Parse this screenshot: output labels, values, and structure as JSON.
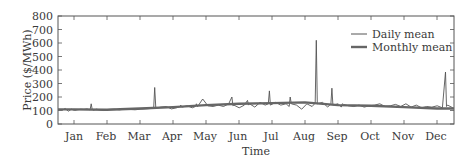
{
  "chart_data": {
    "type": "line",
    "title": "",
    "xlabel": "Time",
    "ylabel": "Price ($/MWh)",
    "ylim": [
      0,
      800
    ],
    "yticks": [
      0,
      100,
      200,
      300,
      400,
      500,
      600,
      700,
      800
    ],
    "xticks": [
      "Jan",
      "Feb",
      "Mar",
      "Apr",
      "May",
      "Jun",
      "Jul",
      "Aug",
      "Sep",
      "Oct",
      "Nov",
      "Dec"
    ],
    "grid": false,
    "legend": {
      "position": "upper right",
      "entries": [
        "Daily mean",
        "Monthly mean"
      ]
    },
    "colors": {
      "daily": "#555555",
      "monthly": "#666666",
      "axis": "#444444"
    },
    "series": [
      {
        "name": "Daily mean",
        "x_day": [
          0,
          3,
          6,
          9,
          12,
          15,
          18,
          21,
          24,
          27,
          28,
          29,
          30,
          33,
          36,
          40,
          45,
          50,
          55,
          60,
          65,
          70,
          75,
          80,
          85,
          88,
          89,
          90,
          95,
          100,
          105,
          110,
          113,
          114,
          115,
          120,
          125,
          128,
          129,
          130,
          135,
          140,
          145,
          150,
          155,
          160,
          163,
          164,
          165,
          170,
          175,
          178,
          179,
          180,
          185,
          190,
          195,
          198,
          199,
          200,
          205,
          210,
          215,
          218,
          219,
          220,
          225,
          230,
          235,
          240,
          243,
          244,
          245,
          250,
          255,
          258,
          259,
          260,
          265,
          268,
          269,
          270,
          275,
          280,
          285,
          290,
          295,
          300,
          305,
          310,
          315,
          320,
          325,
          330,
          335,
          340,
          345,
          350,
          355,
          360,
          365,
          368,
          369,
          370,
          375
        ],
        "values": [
          100,
          115,
          95,
          110,
          100,
          105,
          110,
          108,
          112,
          105,
          150,
          108,
          102,
          110,
          105,
          100,
          108,
          110,
          105,
          110,
          108,
          105,
          110,
          112,
          115,
          120,
          270,
          118,
          125,
          130,
          112,
          120,
          130,
          140,
          125,
          135,
          120,
          130,
          150,
          128,
          185,
          135,
          130,
          140,
          130,
          150,
          200,
          135,
          140,
          120,
          140,
          175,
          140,
          150,
          125,
          160,
          140,
          150,
          245,
          140,
          160,
          140,
          150,
          130,
          200,
          150,
          140,
          110,
          150,
          130,
          155,
          620,
          150,
          160,
          125,
          150,
          265,
          140,
          150,
          125,
          150,
          145,
          135,
          130,
          140,
          125,
          135,
          140,
          150,
          130,
          135,
          145,
          130,
          150,
          125,
          140,
          120,
          130,
          125,
          135,
          120,
          385,
          130,
          140,
          120
        ],
        "note": "Approximate values read from pixels; notable spikes: ~270 (Mar), ~245 (Jun), ~620 (late Jul), ~265 (early Aug), ~385 (late Sep), ~230 (early Oct), ~260 (Dec)"
      },
      {
        "name": "Monthly mean",
        "categories": [
          "Jan",
          "Feb",
          "Mar",
          "Apr",
          "May",
          "Jun",
          "Jul",
          "Aug",
          "Sep",
          "Oct",
          "Nov",
          "Dec"
        ],
        "values": [
          108,
          105,
          115,
          125,
          140,
          150,
          155,
          160,
          140,
          135,
          125,
          115
        ]
      }
    ]
  },
  "text": {
    "ylabel": "Price ($/MWh)",
    "xlabel": "Time",
    "legend_daily": "Daily mean",
    "legend_monthly": "Monthly mean",
    "y0": "0",
    "y1": "100",
    "y2": "200",
    "y3": "300",
    "y4": "400",
    "y5": "500",
    "y6": "600",
    "y7": "700",
    "y8": "800",
    "m0": "Jan",
    "m1": "Feb",
    "m2": "Mar",
    "m3": "Apr",
    "m4": "May",
    "m5": "Jun",
    "m6": "Jul",
    "m7": "Aug",
    "m8": "Sep",
    "m9": "Oct",
    "m10": "Nov",
    "m11": "Dec"
  }
}
